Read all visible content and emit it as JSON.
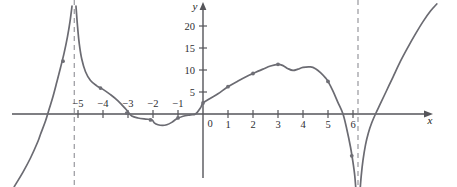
{
  "figure": {
    "kind": "cartesian-function-graph",
    "background_color": "#ffffff",
    "curve_color": "#6b6b72",
    "axis_color": "#55555a",
    "asymptote_color": "#8e8e94",
    "label_color": "#2e2e33"
  },
  "axes": {
    "x_axis_label": "x",
    "y_axis_label": "y",
    "x_tick_labels": [
      "−5",
      "−4",
      "−3",
      "−2",
      "−1",
      "0",
      "1",
      "2",
      "3",
      "4",
      "5",
      "6"
    ],
    "x_tick_values": [
      -5,
      -4,
      -3,
      -2,
      -1,
      0,
      1,
      2,
      3,
      4,
      5,
      6
    ],
    "y_tick_labels": [
      "5",
      "10",
      "15",
      "20"
    ],
    "y_tick_values": [
      5,
      10,
      15,
      20
    ],
    "origin_label": "0",
    "x_range": [
      -7.6,
      9.4
    ],
    "y_range": [
      -18,
      25
    ],
    "grid": "off",
    "pixels_per_x_unit": 25,
    "pixels_per_y_unit": 4.4
  },
  "chart_data": {
    "type": "line",
    "title": "",
    "xlabel": "x",
    "ylabel": "y",
    "grid": false,
    "legend": "none",
    "xlim": [
      -7.6,
      9.4
    ],
    "ylim": [
      -18,
      25
    ],
    "xticks": [
      -5,
      -4,
      -3,
      -2,
      -1,
      0,
      1,
      2,
      3,
      4,
      5,
      6
    ],
    "yticks": [
      5,
      10,
      15,
      20
    ],
    "vertical_asymptotes": [
      -5.15,
      6.2
    ],
    "x_intercepts": [
      -6.5,
      -0.3,
      5.6,
      6.9
    ],
    "y_intercept": 2.5,
    "branches": [
      {
        "name": "left-branch-below-axis",
        "description": "Rises from lower-left, crosses x-axis near x=-6.5, climbs steeply to +infinity at the asymptote x=-5.15",
        "points": [
          [
            -7.55,
            -16.5
          ],
          [
            -7.2,
            -13.2
          ],
          [
            -6.9,
            -10.0
          ],
          [
            -6.6,
            -6.2
          ],
          [
            -6.5,
            -4.6
          ],
          [
            -6.3,
            -1.6
          ],
          [
            -6.15,
            1.2
          ],
          [
            -6.0,
            4.0
          ],
          [
            -5.85,
            7.2
          ],
          [
            -5.7,
            10.5
          ],
          [
            -5.55,
            14.0
          ],
          [
            -5.42,
            17.6
          ],
          [
            -5.32,
            21.0
          ],
          [
            -5.24,
            24.5
          ]
        ]
      },
      {
        "name": "middle-branch",
        "description": "Drops from +infinity just right of x=-5.15, falls steeply, crosses axis near x=-3, dips to a local minimum near x=-1.6, rises through y-intercept 2.5, climbs to local max 11.3 at x=3, small dip near x=3.6, second local max 10.7 near x=4.3, then plunges through x-axis at x=5.6 to -infinity at x=6.2",
        "points": [
          [
            -5.08,
            24.5
          ],
          [
            -5.02,
            20.0
          ],
          [
            -4.95,
            16.0
          ],
          [
            -4.85,
            12.5
          ],
          [
            -4.7,
            9.6
          ],
          [
            -4.5,
            7.6
          ],
          [
            -4.25,
            6.4
          ],
          [
            -4.0,
            5.6
          ],
          [
            -3.7,
            4.4
          ],
          [
            -3.4,
            3.0
          ],
          [
            -3.1,
            1.2
          ],
          [
            -3.0,
            0.5
          ],
          [
            -2.85,
            -0.45
          ],
          [
            -2.6,
            -0.9
          ],
          [
            -2.3,
            -1.15
          ],
          [
            -2.05,
            -1.3
          ],
          [
            -1.95,
            -2.0
          ],
          [
            -1.8,
            -2.45
          ],
          [
            -1.62,
            -2.6
          ],
          [
            -1.45,
            -2.45
          ],
          [
            -1.25,
            -1.9
          ],
          [
            -1.05,
            -1.1
          ],
          [
            -0.8,
            -0.5
          ],
          [
            -0.5,
            -0.2
          ],
          [
            -0.3,
            0.0
          ],
          [
            -0.1,
            1.4
          ],
          [
            0.0,
            2.5
          ],
          [
            0.3,
            3.6
          ],
          [
            0.6,
            4.6
          ],
          [
            1.0,
            6.2
          ],
          [
            1.4,
            7.5
          ],
          [
            1.8,
            8.7
          ],
          [
            2.0,
            9.2
          ],
          [
            2.4,
            10.2
          ],
          [
            2.7,
            10.9
          ],
          [
            3.0,
            11.3
          ],
          [
            3.2,
            11.0
          ],
          [
            3.4,
            10.3
          ],
          [
            3.6,
            9.9
          ],
          [
            3.8,
            10.2
          ],
          [
            4.0,
            10.6
          ],
          [
            4.3,
            10.7
          ],
          [
            4.5,
            10.3
          ],
          [
            4.7,
            9.4
          ],
          [
            4.9,
            8.2
          ],
          [
            5.0,
            7.4
          ],
          [
            5.2,
            5.2
          ],
          [
            5.4,
            2.6
          ],
          [
            5.6,
            0.0
          ],
          [
            5.75,
            -3.4
          ],
          [
            5.9,
            -7.5
          ],
          [
            6.0,
            -11.0
          ],
          [
            6.07,
            -14.0
          ],
          [
            6.12,
            -17.5
          ]
        ]
      },
      {
        "name": "right-branch",
        "description": "Comes up from -infinity just right of the asymptote x=6.2, crosses the x-axis near x=6.9 and rises to the top-right corner",
        "points": [
          [
            6.28,
            -17.5
          ],
          [
            6.33,
            -14.0
          ],
          [
            6.4,
            -10.5
          ],
          [
            6.5,
            -7.0
          ],
          [
            6.62,
            -4.2
          ],
          [
            6.75,
            -2.0
          ],
          [
            6.9,
            0.0
          ],
          [
            7.1,
            2.4
          ],
          [
            7.35,
            5.4
          ],
          [
            7.6,
            8.4
          ],
          [
            7.9,
            12.0
          ],
          [
            8.2,
            15.2
          ],
          [
            8.5,
            18.2
          ],
          [
            8.8,
            21.0
          ],
          [
            9.1,
            23.4
          ],
          [
            9.35,
            25.0
          ]
        ]
      }
    ],
    "marked_points": [
      {
        "x": -5.6,
        "y": 12.0
      },
      {
        "x": -4.1,
        "y": 5.9
      },
      {
        "x": -3.05,
        "y": 0.2
      },
      {
        "x": -2.1,
        "y": -1.35
      },
      {
        "x": -1.0,
        "y": -0.9
      },
      {
        "x": 0.0,
        "y": 2.5
      },
      {
        "x": 1.0,
        "y": 6.2
      },
      {
        "x": 2.0,
        "y": 9.2
      },
      {
        "x": 3.0,
        "y": 11.3
      },
      {
        "x": 5.0,
        "y": 7.4
      },
      {
        "x": 5.95,
        "y": -9.5
      }
    ]
  }
}
